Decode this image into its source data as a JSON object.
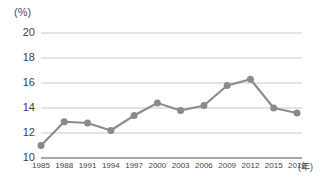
{
  "chart_data": {
    "type": "line",
    "title": "",
    "subtitle": "",
    "xlabel": "(年)",
    "ylabel": "(%)",
    "categories": [
      "1985",
      "1988",
      "1991",
      "1994",
      "1997",
      "2000",
      "2003",
      "2006",
      "2009",
      "2012",
      "2015",
      "2018"
    ],
    "values": [
      11.0,
      12.9,
      12.8,
      12.2,
      13.4,
      14.4,
      13.8,
      14.2,
      15.8,
      16.3,
      14.0,
      13.6
    ],
    "series": [
      {
        "name": "",
        "values": [
          11.0,
          12.9,
          12.8,
          12.2,
          13.4,
          14.4,
          13.8,
          14.2,
          15.8,
          16.3,
          14.0,
          13.6
        ]
      }
    ],
    "ylim": [
      10,
      20
    ],
    "yticks": [
      10,
      12,
      14,
      16,
      18,
      20
    ],
    "ytick_labels": [
      "10",
      "12",
      "14",
      "16",
      "18",
      "20"
    ],
    "xtick_labels": [
      "1985",
      "1988",
      "1991",
      "1994",
      "1997",
      "2000",
      "2003",
      "2006",
      "2009",
      "2012",
      "2015",
      "2018"
    ],
    "grid": true,
    "grid_axis": "y",
    "legend": false,
    "legend_position": "none",
    "marker": "circle",
    "line_color": "#8c8c8c",
    "marker_color": "#8a8a8a",
    "grid_color": "#c9c9c9",
    "axis_color": "#8a8a8a",
    "text_color": "#3f3f3f",
    "background": "#ffffff"
  },
  "axes": {
    "y_unit": "(%)",
    "x_unit": "(年)"
  }
}
